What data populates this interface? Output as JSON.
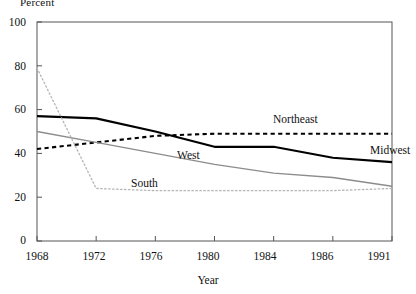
{
  "chart_data": {
    "type": "line",
    "title": "",
    "xlabel": "Year",
    "ylabel": "Percent",
    "categories": [
      "1968",
      "1972",
      "1976",
      "1980",
      "1984",
      "1986",
      "1991"
    ],
    "xlim_categorical": true,
    "ylim": [
      0,
      100
    ],
    "yticks": [
      0,
      20,
      40,
      60,
      80,
      100
    ],
    "grid": false,
    "legend_position": "inline-annotations",
    "series": [
      {
        "name": "Midwest",
        "values": [
          57,
          56,
          50,
          43,
          43,
          38,
          36
        ],
        "style": "solid",
        "color": "#000000",
        "width": 2.1,
        "label_x": 370,
        "label_y": 151
      },
      {
        "name": "Northeast",
        "values": [
          42,
          45,
          48,
          49,
          49,
          49,
          49
        ],
        "style": "dashed",
        "color": "#000000",
        "width": 2.1,
        "label_x": 273,
        "label_y": 120
      },
      {
        "name": "West",
        "values": [
          50,
          45,
          40,
          35,
          31,
          29,
          25
        ],
        "style": "solid",
        "color": "#8c8c8c",
        "width": 1.3,
        "label_x": 177,
        "label_y": 156
      },
      {
        "name": "South",
        "values": [
          79,
          24,
          23,
          23,
          23,
          23,
          24
        ],
        "style": "dotted",
        "color": "#b5b5b5",
        "width": 1.3,
        "label_x": 131,
        "label_y": 184
      }
    ]
  },
  "axis": {
    "y_tick_labels": [
      "100",
      "80",
      "60",
      "40",
      "20",
      "0"
    ],
    "x_tick_labels": [
      "1968",
      "1972",
      "1976",
      "1980",
      "1984",
      "1986",
      "1991"
    ],
    "y_axis_title": "Percent",
    "x_axis_title": "Year"
  },
  "frame": {
    "border_color": "#555555",
    "background": "#ffffff"
  }
}
